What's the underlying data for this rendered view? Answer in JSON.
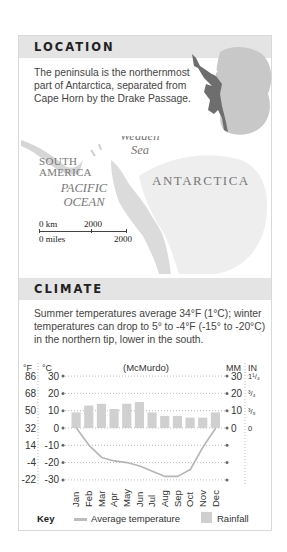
{
  "location": {
    "title": "LOCATION",
    "text": "The peninsula is the northernmost part of Antarctica, separated from Cape Horn by the Drake Passage."
  },
  "map": {
    "labels": {
      "south_america": "SOUTH AMERICA",
      "south": "SOUTH",
      "america": "AMERICA",
      "pacific": "PACIFIC",
      "ocean": "OCEAN",
      "weddell": "Weddell",
      "sea": "Sea",
      "antarctica": "ANTARCTICA"
    },
    "scale": {
      "km_start": "0 km",
      "km_end": "2000",
      "miles_start": "0 miles",
      "miles_end": "2000"
    }
  },
  "climate": {
    "title": "CLIMATE",
    "text": "Summer temperatures average 34°F (1°C); winter temperatures can drop to 5° to -4°F (-15° to -20°C) in the northern tip, lower in the south."
  },
  "chart_data": {
    "type": "bar",
    "title": "(McMurdo)",
    "categories": [
      "Jan",
      "Feb",
      "Mar",
      "Apr",
      "May",
      "Jun",
      "Jul",
      "Aug",
      "Sep",
      "Oct",
      "Nov",
      "Dec"
    ],
    "series": [
      {
        "name": "Rainfall",
        "type": "bar",
        "unit": "mm",
        "values": [
          9,
          13,
          14,
          11,
          14,
          15,
          9,
          7,
          7,
          6,
          6,
          9
        ]
      },
      {
        "name": "Average temperature",
        "type": "line",
        "unit": "°C",
        "values": [
          0,
          -10,
          -17,
          -19,
          -20,
          -22,
          -25,
          -28,
          -28,
          -24,
          -11,
          0
        ]
      }
    ],
    "left_axis": {
      "label_f": "°F",
      "label_c": "°C",
      "ticks_c": [
        30,
        20,
        10,
        0,
        -10,
        -20,
        -30
      ],
      "ticks_f": [
        86,
        68,
        50,
        32,
        14,
        -4,
        -22
      ]
    },
    "right_axis": {
      "label_mm": "MM",
      "label_in": "IN",
      "ticks_mm": [
        30,
        20,
        10,
        0
      ],
      "ticks_in": [
        "1¹/₄",
        "³/₄",
        "³/₈",
        "0"
      ]
    },
    "ylim": [
      -30,
      30
    ],
    "grid": true,
    "legend_position": "bottom"
  },
  "key": {
    "label": "Key",
    "temperature": "Average temperature",
    "rainfall": "Rainfall"
  },
  "colors": {
    "header_bg": "#e4e4e4",
    "bar": "#d0d0d0",
    "line": "#b5b5b5",
    "peninsula": "#6e6e6e",
    "continent": "#c8c8c8"
  }
}
